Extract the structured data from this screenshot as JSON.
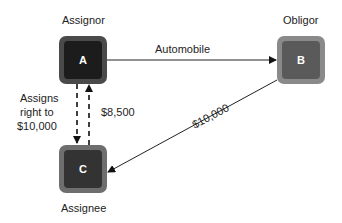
{
  "nodes": {
    "a": {
      "letter": "A",
      "role": "Assignor",
      "outer": "#4a4a4a",
      "inner": "#1c1c1c"
    },
    "b": {
      "letter": "B",
      "role": "Obligor",
      "outer": "#8a8a8a",
      "inner": "#5a5a5a"
    },
    "c": {
      "letter": "C",
      "role": "Assignee",
      "outer": "#6e6e6e",
      "inner": "#333333"
    }
  },
  "edges": {
    "a_to_b": "Automobile",
    "b_to_c": "$10,000",
    "a_to_c": "Assigns right to $10,000",
    "a_to_c_lines": [
      "Assigns",
      "right to",
      "$10,000"
    ],
    "c_to_a": "$8,500"
  }
}
